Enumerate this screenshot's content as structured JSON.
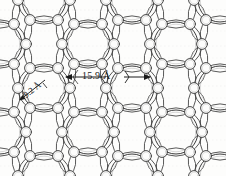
{
  "figure": {
    "background_color": "#fdfdfc",
    "line_color": "#3b3b3b",
    "faint_line_color": "#cfcfcf",
    "scan_line_color": "#dedede"
  },
  "annotations": {
    "pore_to_pore": {
      "value": "15.9 A",
      "text": "15.9 Å",
      "orientation": "horizontal",
      "arrow_left_x": 62,
      "arrow_right_x": 150,
      "y": 77
    },
    "pore_diameter": {
      "value": "9.2 A",
      "text": "9.2 Å",
      "orientation": "diagonal",
      "arrow_tip_x": 16,
      "arrow_tip_y": 102,
      "y": 96
    }
  },
  "lattice": {
    "type": "hexagonal",
    "pore_radius": 22,
    "node_radius": 5.4,
    "period_x": 88,
    "period_y": 88,
    "pore_centers": [
      [
        44,
        0
      ],
      [
        132,
        0
      ],
      [
        220,
        0
      ],
      [
        0,
        44
      ],
      [
        88,
        44
      ],
      [
        176,
        44
      ],
      [
        44,
        88
      ],
      [
        132,
        88
      ],
      [
        220,
        88
      ],
      [
        0,
        132
      ],
      [
        88,
        132
      ],
      [
        176,
        132
      ],
      [
        44,
        176
      ],
      [
        132,
        176
      ],
      [
        220,
        176
      ]
    ],
    "node_offsets": [
      [
        -14,
        -20
      ],
      [
        14,
        -20
      ],
      [
        26,
        0
      ],
      [
        14,
        20
      ],
      [
        -14,
        20
      ],
      [
        -26,
        0
      ]
    ]
  },
  "scan_lines": [
    {
      "y": 10,
      "opacity": 0.3
    },
    {
      "y": 18,
      "opacity": 0.22
    },
    {
      "y": 31,
      "opacity": 0.18
    },
    {
      "y": 46,
      "opacity": 0.26
    },
    {
      "y": 58,
      "opacity": 0.16
    },
    {
      "y": 69,
      "opacity": 0.2
    },
    {
      "y": 86,
      "opacity": 0.28
    },
    {
      "y": 98,
      "opacity": 0.18
    },
    {
      "y": 112,
      "opacity": 0.22
    },
    {
      "y": 126,
      "opacity": 0.16
    },
    {
      "y": 140,
      "opacity": 0.24
    },
    {
      "y": 155,
      "opacity": 0.18
    },
    {
      "y": 166,
      "opacity": 0.2
    }
  ]
}
